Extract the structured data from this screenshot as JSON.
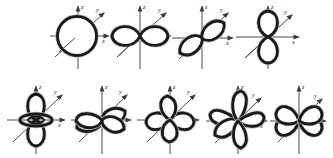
{
  "figure": {
    "background_color": "#ffffff",
    "orbital_stroke_color": "#1a1a1a",
    "axis_color": "#4a4a4a",
    "label_color": "#2b2b2b",
    "rows": 2,
    "columns_row1": 4,
    "columns_row2": 5,
    "total_panels": 9
  },
  "axes": {
    "x_label": "x",
    "y_label": "y",
    "z_label": "z",
    "style": "italic",
    "description": "three-dimensional Cartesian axes, z vertical, x horizontal, y oblique to upper-right"
  },
  "panels": [
    {
      "index": 1,
      "row": 1,
      "column": 1,
      "orbital": "s",
      "shape": "sphere",
      "lobes": 1,
      "x_label": "x",
      "y_label": "y",
      "z_label": "z"
    },
    {
      "index": 2,
      "row": 1,
      "column": 2,
      "orbital": "px",
      "shape": "dumbbell along x",
      "lobes": 2,
      "x_label": "x",
      "y_label": "y",
      "z_label": "z"
    },
    {
      "index": 3,
      "row": 1,
      "column": 3,
      "orbital": "py",
      "shape": "dumbbell along y",
      "lobes": 2,
      "x_label": "x",
      "y_label": "y",
      "z_label": "z"
    },
    {
      "index": 4,
      "row": 1,
      "column": 4,
      "orbital": "pz",
      "shape": "dumbbell along z",
      "lobes": 2,
      "x_label": "x",
      "y_label": "y",
      "z_label": "z"
    },
    {
      "index": 5,
      "row": 2,
      "column": 1,
      "orbital": "dz2",
      "shape": "dumbbell along z with toroidal ring",
      "lobes": 2,
      "has_torus": true,
      "x_label": "x",
      "y_label": "y",
      "z_label": "z"
    },
    {
      "index": 6,
      "row": 2,
      "column": 2,
      "orbital": "dxy",
      "shape": "four lobes in xy plane",
      "lobes": 4,
      "x_label": "x",
      "y_label": "y",
      "z_label": "z"
    },
    {
      "index": 7,
      "row": 2,
      "column": 3,
      "orbital": "dyz",
      "shape": "four lobes in yz plane",
      "lobes": 4,
      "x_label": "x",
      "y_label": "y",
      "z_label": "z"
    },
    {
      "index": 8,
      "row": 2,
      "column": 4,
      "orbital": "dxz",
      "shape": "four lobes in xz plane between axes",
      "lobes": 4,
      "x_label": "x",
      "y_label": "y",
      "z_label": "z"
    },
    {
      "index": 9,
      "row": 2,
      "column": 5,
      "orbital": "dx2-y2",
      "shape": "four lobes along x and z axes",
      "lobes": 4,
      "x_label": "x",
      "y_label": "y",
      "z_label": "z"
    }
  ]
}
